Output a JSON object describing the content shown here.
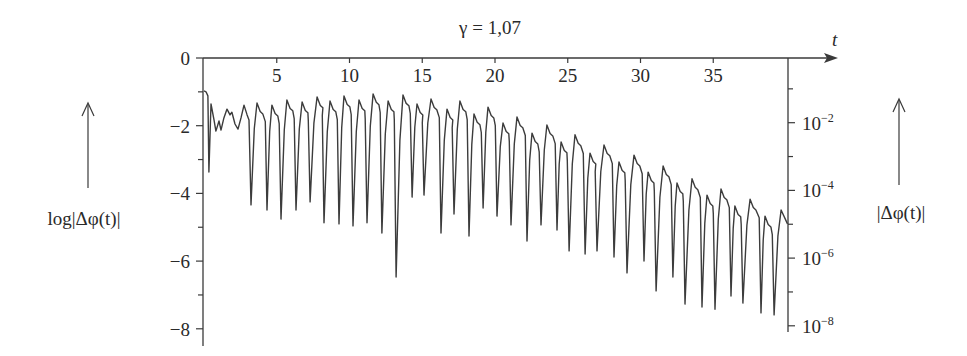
{
  "chart_data": {
    "type": "line",
    "title": "γ = 1,07",
    "xlabel": "t",
    "ylabel_left": "log|Δφ(t)|",
    "ylabel_right": "|Δφ(t)|",
    "xlim": [
      0,
      40
    ],
    "ylim": [
      -8.5,
      0
    ],
    "grid": false,
    "legend": null,
    "x_ticks": [
      5,
      10,
      15,
      20,
      25,
      30,
      35
    ],
    "y_ticks_left": [
      0,
      -2,
      -4,
      -6,
      -8
    ],
    "y_minor_ticks_left": [
      -1,
      -3,
      -5,
      -7
    ],
    "y_ticks_right": [
      {
        "exp": "-2",
        "value": 0.01
      },
      {
        "exp": "-4",
        "value": 0.0001
      },
      {
        "exp": "-6",
        "value": 1e-06
      },
      {
        "exp": "-8",
        "value": 1e-08
      }
    ],
    "y_minor_ticks_right_exp": [
      -1,
      -3,
      -5,
      -7
    ],
    "series": [
      {
        "name": "log|Δφ(t)|",
        "color": "#3c3c3c",
        "initial_transient": [
          [
            0.0,
            -0.97
          ],
          [
            0.14,
            -1.0
          ],
          [
            0.27,
            -1.12
          ],
          [
            0.34,
            -3.37
          ],
          [
            0.48,
            -1.36
          ],
          [
            0.69,
            -1.83
          ],
          [
            0.82,
            -2.16
          ],
          [
            1.03,
            -1.86
          ],
          [
            1.17,
            -2.13
          ],
          [
            1.37,
            -1.77
          ],
          [
            1.58,
            -1.51
          ],
          [
            1.79,
            -1.68
          ],
          [
            1.92,
            -1.6
          ],
          [
            2.13,
            -1.95
          ],
          [
            2.34,
            -2.1
          ],
          [
            2.54,
            -1.77
          ],
          [
            2.75,
            -1.39
          ],
          [
            2.96,
            -1.68
          ],
          [
            3.09,
            -1.83
          ]
        ],
        "dips": [
          [
            3.23,
            -4.34
          ],
          [
            4.33,
            -4.49
          ],
          [
            5.29,
            -4.76
          ],
          [
            6.32,
            -4.49
          ],
          [
            7.29,
            -4.25
          ],
          [
            8.25,
            -4.87
          ],
          [
            9.28,
            -4.9
          ],
          [
            10.24,
            -4.96
          ],
          [
            11.2,
            -4.87
          ],
          [
            12.23,
            -5.17
          ],
          [
            13.2,
            -6.47
          ],
          [
            14.3,
            -4.11
          ],
          [
            15.12,
            -4.05
          ],
          [
            16.29,
            -5.17
          ],
          [
            17.18,
            -4.61
          ],
          [
            18.21,
            -5.26
          ],
          [
            19.18,
            -4.43
          ],
          [
            20.14,
            -4.67
          ],
          [
            21.1,
            -4.93
          ],
          [
            22.2,
            -5.41
          ],
          [
            23.16,
            -4.93
          ],
          [
            24.26,
            -5.08
          ],
          [
            25.09,
            -5.7
          ],
          [
            26.19,
            -5.79
          ],
          [
            27.01,
            -5.7
          ],
          [
            28.18,
            -5.88
          ],
          [
            29.07,
            -6.35
          ],
          [
            30.24,
            -6.0
          ],
          [
            31.07,
            -6.88
          ],
          [
            32.23,
            -6.47
          ],
          [
            33.06,
            -7.27
          ],
          [
            34.23,
            -7.36
          ],
          [
            35.12,
            -7.42
          ],
          [
            36.22,
            -7.03
          ],
          [
            37.04,
            -7.24
          ],
          [
            38.28,
            -7.53
          ],
          [
            39.18,
            -7.59
          ]
        ],
        "peaks": [
          [
            3.64,
            -1.33
          ],
          [
            4.67,
            -1.39
          ],
          [
            5.7,
            -1.24
          ],
          [
            6.74,
            -1.3
          ],
          [
            7.77,
            -1.15
          ],
          [
            8.66,
            -1.27
          ],
          [
            9.62,
            -1.12
          ],
          [
            10.65,
            -1.24
          ],
          [
            11.62,
            -1.06
          ],
          [
            12.65,
            -1.27
          ],
          [
            13.68,
            -1.09
          ],
          [
            14.64,
            -1.36
          ],
          [
            15.6,
            -1.21
          ],
          [
            16.7,
            -1.51
          ],
          [
            17.59,
            -1.27
          ],
          [
            18.56,
            -1.65
          ],
          [
            19.52,
            -1.45
          ],
          [
            20.55,
            -1.92
          ],
          [
            21.51,
            -1.74
          ],
          [
            22.54,
            -2.22
          ],
          [
            23.57,
            -1.98
          ],
          [
            24.54,
            -2.48
          ],
          [
            25.5,
            -2.27
          ],
          [
            26.53,
            -2.81
          ],
          [
            27.49,
            -2.57
          ],
          [
            28.52,
            -3.07
          ],
          [
            29.55,
            -2.87
          ],
          [
            30.52,
            -3.37
          ],
          [
            31.55,
            -3.19
          ],
          [
            32.51,
            -3.69
          ],
          [
            33.54,
            -3.57
          ],
          [
            34.57,
            -4.05
          ],
          [
            35.53,
            -3.87
          ],
          [
            36.49,
            -4.37
          ],
          [
            37.53,
            -4.17
          ],
          [
            38.56,
            -4.67
          ],
          [
            39.66,
            -4.49
          ]
        ],
        "end_point": [
          40.1,
          -4.9
        ]
      }
    ]
  },
  "labels": {
    "title": "γ = 1,07",
    "x_axis": "t",
    "left_axis": "log|Δφ(t)|",
    "right_axis": "|Δφ(t)|",
    "left_ticks": [
      "0",
      "−2",
      "−4",
      "−6",
      "−8"
    ],
    "x_ticks": [
      "5",
      "10",
      "15",
      "20",
      "25",
      "30",
      "35"
    ],
    "right_tick_base": "10",
    "right_tick_exps": [
      "−2",
      "−4",
      "−6",
      "−8"
    ]
  }
}
